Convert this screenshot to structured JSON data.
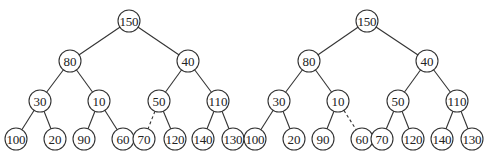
{
  "diagram": {
    "type": "binary-tree-pair",
    "node_radius": 11,
    "trees": [
      {
        "id": "left",
        "nodes": [
          {
            "id": "n0",
            "label": "150",
            "x": 129,
            "y": 21
          },
          {
            "id": "n1",
            "label": "80",
            "x": 70,
            "y": 61
          },
          {
            "id": "n2",
            "label": "40",
            "x": 188,
            "y": 61
          },
          {
            "id": "n3",
            "label": "30",
            "x": 40,
            "y": 101
          },
          {
            "id": "n4",
            "label": "10",
            "x": 99,
            "y": 101
          },
          {
            "id": "n5",
            "label": "50",
            "x": 159,
            "y": 101
          },
          {
            "id": "n6",
            "label": "110",
            "x": 218,
            "y": 101
          },
          {
            "id": "n7",
            "label": "100",
            "x": 16,
            "y": 139
          },
          {
            "id": "n8",
            "label": "20",
            "x": 55,
            "y": 139
          },
          {
            "id": "n9",
            "label": "90",
            "x": 84,
            "y": 139
          },
          {
            "id": "n10",
            "label": "60",
            "x": 123,
            "y": 139
          },
          {
            "id": "n11",
            "label": "70",
            "x": 144,
            "y": 139
          },
          {
            "id": "n12",
            "label": "120",
            "x": 175,
            "y": 139
          },
          {
            "id": "n13",
            "label": "140",
            "x": 203,
            "y": 139
          },
          {
            "id": "n14",
            "label": "130",
            "x": 233,
            "y": 139
          }
        ],
        "edges": [
          {
            "from": "n0",
            "to": "n1",
            "dashed": false
          },
          {
            "from": "n0",
            "to": "n2",
            "dashed": false
          },
          {
            "from": "n1",
            "to": "n3",
            "dashed": false
          },
          {
            "from": "n1",
            "to": "n4",
            "dashed": false
          },
          {
            "from": "n2",
            "to": "n5",
            "dashed": false
          },
          {
            "from": "n2",
            "to": "n6",
            "dashed": false
          },
          {
            "from": "n3",
            "to": "n7",
            "dashed": false
          },
          {
            "from": "n3",
            "to": "n8",
            "dashed": false
          },
          {
            "from": "n4",
            "to": "n9",
            "dashed": false
          },
          {
            "from": "n4",
            "to": "n10",
            "dashed": false
          },
          {
            "from": "n5",
            "to": "n11",
            "dashed": true
          },
          {
            "from": "n5",
            "to": "n12",
            "dashed": false
          },
          {
            "from": "n6",
            "to": "n13",
            "dashed": false
          },
          {
            "from": "n6",
            "to": "n14",
            "dashed": false
          }
        ]
      },
      {
        "id": "right",
        "nodes": [
          {
            "id": "n0",
            "label": "150",
            "x": 367,
            "y": 21
          },
          {
            "id": "n1",
            "label": "80",
            "x": 309,
            "y": 61
          },
          {
            "id": "n2",
            "label": "40",
            "x": 427,
            "y": 61
          },
          {
            "id": "n3",
            "label": "30",
            "x": 279,
            "y": 101
          },
          {
            "id": "n4",
            "label": "10",
            "x": 338,
            "y": 101
          },
          {
            "id": "n5",
            "label": "50",
            "x": 398,
            "y": 101
          },
          {
            "id": "n6",
            "label": "110",
            "x": 457,
            "y": 101
          },
          {
            "id": "n7",
            "label": "100",
            "x": 255,
            "y": 139
          },
          {
            "id": "n8",
            "label": "20",
            "x": 294,
            "y": 139
          },
          {
            "id": "n9",
            "label": "90",
            "x": 323,
            "y": 139
          },
          {
            "id": "n10",
            "label": "60",
            "x": 362,
            "y": 139
          },
          {
            "id": "n11",
            "label": "70",
            "x": 382,
            "y": 139
          },
          {
            "id": "n12",
            "label": "120",
            "x": 413,
            "y": 139
          },
          {
            "id": "n13",
            "label": "140",
            "x": 442,
            "y": 139
          },
          {
            "id": "n14",
            "label": "130",
            "x": 472,
            "y": 139
          }
        ],
        "edges": [
          {
            "from": "n0",
            "to": "n1",
            "dashed": false
          },
          {
            "from": "n0",
            "to": "n2",
            "dashed": false
          },
          {
            "from": "n1",
            "to": "n3",
            "dashed": false
          },
          {
            "from": "n1",
            "to": "n4",
            "dashed": false
          },
          {
            "from": "n2",
            "to": "n5",
            "dashed": false
          },
          {
            "from": "n2",
            "to": "n6",
            "dashed": false
          },
          {
            "from": "n3",
            "to": "n7",
            "dashed": false
          },
          {
            "from": "n3",
            "to": "n8",
            "dashed": false
          },
          {
            "from": "n4",
            "to": "n9",
            "dashed": false
          },
          {
            "from": "n4",
            "to": "n10",
            "dashed": true
          },
          {
            "from": "n5",
            "to": "n11",
            "dashed": false
          },
          {
            "from": "n5",
            "to": "n12",
            "dashed": false
          },
          {
            "from": "n6",
            "to": "n13",
            "dashed": false
          },
          {
            "from": "n6",
            "to": "n14",
            "dashed": false
          }
        ]
      }
    ]
  }
}
